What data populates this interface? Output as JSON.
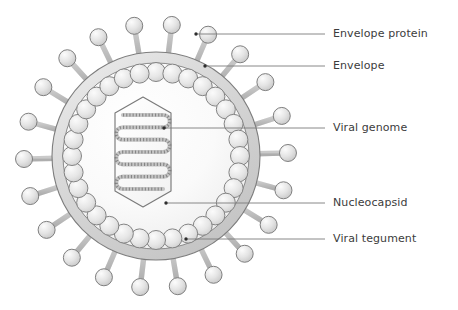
{
  "figure": {
    "background_color": "#ffffff"
  },
  "palette": {
    "outline": "#808080",
    "outline_dark": "#6b6b6b",
    "envelope_fill": "#d9d9d9",
    "envelope_fill_light": "#ececec",
    "interior_fill": "#f7f7f7",
    "tegument_fill": "#e3e3e3",
    "spike_fill": "#dcdcdc",
    "spike_stalk_fill": "#d2d2d2",
    "capsid_fill": "#fbfbfb",
    "genome_color": "#9a9a9a",
    "leader_line": "#7a7a7a",
    "anchor_dot": "#2e2e2e",
    "label_text": "#3c3c3c"
  },
  "virus": {
    "center_x": 156,
    "center_y": 156,
    "envelope_outer_radius": 104,
    "envelope_inner_radius": 93,
    "tegument_ring_radius": 84,
    "tegument_bead_radius": 9.5,
    "tegument_bead_count": 32,
    "spike_count": 22,
    "spike_stalk_length": 22,
    "spike_head_radius": 8.5,
    "capsid": {
      "shape": "elongated-hexagon",
      "center_x": 143,
      "center_y": 152,
      "half_width": 28,
      "half_height": 55,
      "corner_inset": 16
    },
    "genome": {
      "shape": "serpentine-coil",
      "runs": 7,
      "texture": "helical-hatching"
    }
  },
  "callouts": [
    {
      "id": "envelope-protein",
      "label": "Envelope protein",
      "label_x": 333,
      "label_y": 27,
      "line_x1": 196,
      "line_y1": 34,
      "line_x2": 325,
      "line_y2": 34,
      "anchor_x": 196,
      "anchor_y": 34
    },
    {
      "id": "envelope",
      "label": "Envelope",
      "label_x": 333,
      "label_y": 59,
      "line_x1": 205,
      "line_y1": 66,
      "line_x2": 325,
      "line_y2": 66,
      "anchor_x": 205,
      "anchor_y": 66
    },
    {
      "id": "viral-genome",
      "label": "Viral genome",
      "label_x": 333,
      "label_y": 121,
      "line_x1": 164,
      "line_y1": 128,
      "line_x2": 325,
      "line_y2": 128,
      "anchor_x": 164,
      "anchor_y": 128
    },
    {
      "id": "nucleocapsid",
      "label": "Nucleocapsid",
      "label_x": 333,
      "label_y": 196,
      "line_x1": 166,
      "line_y1": 203,
      "line_x2": 325,
      "line_y2": 203,
      "anchor_x": 166,
      "anchor_y": 203
    },
    {
      "id": "viral-tegument",
      "label": "Viral tegument",
      "label_x": 333,
      "label_y": 232,
      "line_x1": 186,
      "line_y1": 239,
      "line_x2": 325,
      "line_y2": 239,
      "anchor_x": 186,
      "anchor_y": 239
    }
  ]
}
